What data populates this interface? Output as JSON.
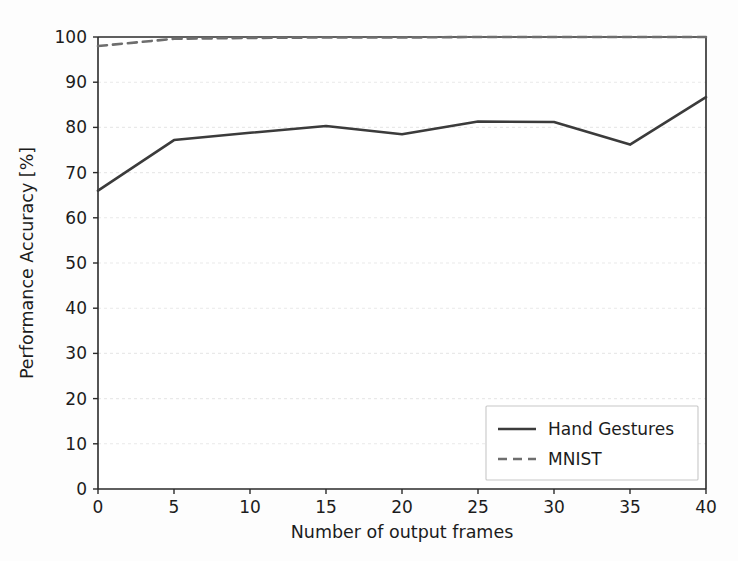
{
  "chart_data": {
    "type": "line",
    "title": "",
    "xlabel": "Number of output frames",
    "ylabel": "Performance Accuracy [%]",
    "xlim": [
      0,
      40
    ],
    "ylim": [
      0,
      100
    ],
    "xticks": [
      0,
      5,
      10,
      15,
      20,
      25,
      30,
      35,
      40
    ],
    "yticks": [
      0,
      10,
      20,
      30,
      40,
      50,
      60,
      70,
      80,
      90,
      100
    ],
    "xtick_labels": [
      "0",
      "5",
      "10",
      "15",
      "20",
      "25",
      "30",
      "35",
      "40"
    ],
    "ytick_labels": [
      "0",
      "10",
      "20",
      "30",
      "40",
      "50",
      "60",
      "70",
      "80",
      "90",
      "100"
    ],
    "grid": true,
    "grid_axis": "y",
    "legend_position": "lower right",
    "x": [
      0,
      5,
      10,
      15,
      20,
      25,
      30,
      35,
      40
    ],
    "series": [
      {
        "name": "Hand Gestures",
        "style": "solid",
        "color": "#3b3b3b",
        "values": [
          66.0,
          77.2,
          78.8,
          80.3,
          78.5,
          81.3,
          81.2,
          76.2,
          86.7
        ]
      },
      {
        "name": "MNIST",
        "style": "dashed",
        "color": "#6e6e6e",
        "values": [
          98.0,
          99.6,
          99.8,
          99.9,
          99.9,
          100.0,
          100.0,
          100.0,
          100.0
        ]
      }
    ]
  },
  "legend": {
    "entries": [
      {
        "label": "Hand Gestures",
        "style": "solid"
      },
      {
        "label": "MNIST",
        "style": "dashed"
      }
    ]
  },
  "colors": {
    "series_primary": "#3b3b3b",
    "series_secondary": "#6e6e6e",
    "axis": "#2a2a2a",
    "grid": "#e9e9e9",
    "background": "#fdfdfd"
  }
}
